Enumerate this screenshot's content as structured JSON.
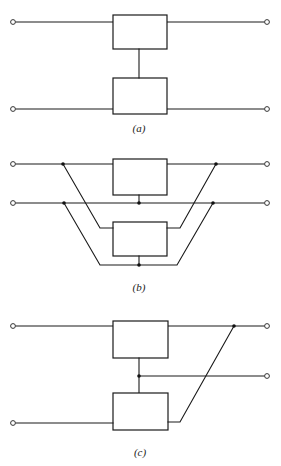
{
  "figure": {
    "panels": [
      {
        "id": "a",
        "label": "(a)",
        "connection": "series"
      },
      {
        "id": "b",
        "label": "(b)",
        "connection": "parallel"
      },
      {
        "id": "c",
        "label": "(c)",
        "connection": "series-parallel"
      }
    ]
  },
  "colors": {
    "line": "#1a1a1a",
    "background": "#ffffff"
  }
}
